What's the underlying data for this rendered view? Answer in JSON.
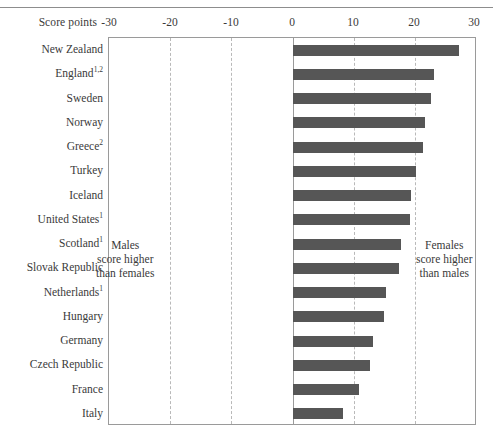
{
  "axis_title": "Score points",
  "annotations": {
    "left": [
      "Males",
      "score higher",
      "than females"
    ],
    "right": [
      "Females",
      "score higher",
      "than males"
    ]
  },
  "chart_data": {
    "type": "bar",
    "orientation": "horizontal",
    "title": "",
    "subtitle": "",
    "xlabel": "Score points",
    "ylabel": "",
    "xlim": [
      -30,
      30
    ],
    "xticks": [
      -30,
      -20,
      -10,
      0,
      10,
      20,
      30
    ],
    "xtick_labels": [
      "-30",
      "-20",
      "-10",
      "0",
      "10",
      "20",
      "30"
    ],
    "grid": true,
    "grid_axis": "x",
    "legend": null,
    "bar_color": "#565656",
    "frame_color": "#9a9a9a",
    "gridline_color": "#b9b9b9",
    "categories": [
      "New Zealand",
      "England",
      "Sweden",
      "Norway",
      "Greece",
      "Turkey",
      "Iceland",
      "United States",
      "Scotland",
      "Slovak Republic",
      "Netherlands",
      "Hungary",
      "Germany",
      "Czech Republic",
      "France",
      "Italy"
    ],
    "category_footnotes": [
      "",
      "1,2",
      "",
      "",
      "2",
      "",
      "",
      "1",
      "1",
      "",
      "1",
      "",
      "",
      "",
      "",
      ""
    ],
    "values": [
      27.0,
      23.0,
      22.5,
      21.5,
      21.2,
      20.0,
      19.3,
      19.0,
      17.6,
      17.3,
      15.2,
      14.8,
      13.0,
      12.6,
      10.8,
      8.2
    ],
    "annotation_texts": [
      "Males score higher than females",
      "Females score higher than males"
    ]
  }
}
